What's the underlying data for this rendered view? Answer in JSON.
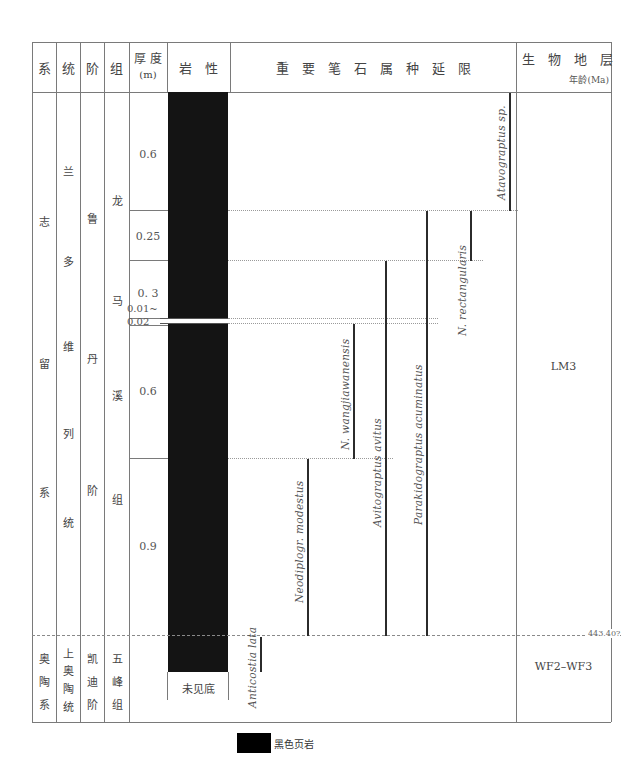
{
  "header": {
    "system": "系",
    "series": "统",
    "stage": "阶",
    "formation": "组",
    "thickness": "厚 度",
    "thickness_unit": "(m)",
    "lithology": "岩　性",
    "graptolite_ranges": "重　要　笔　石　属　种　延　限",
    "biozone": "生　物　地　层",
    "age_unit": "年龄(Ma)"
  },
  "chronostrat": {
    "upper": {
      "system": [
        "志",
        "留",
        "系"
      ],
      "series": [
        "兰",
        "多",
        "维",
        "列",
        "统"
      ],
      "stage": [
        "鲁",
        "丹",
        "阶"
      ],
      "formation": [
        "龙",
        "马",
        "溪",
        "组"
      ]
    },
    "lower": {
      "system": [
        "奥",
        "陶",
        "系"
      ],
      "series": [
        "上",
        "奥",
        "陶",
        "统"
      ],
      "stage": [
        "凯",
        "迪",
        "阶"
      ],
      "formation": [
        "五",
        "峰",
        "组"
      ]
    }
  },
  "thickness_layers": [
    {
      "value": "0.6"
    },
    {
      "value": "0.25"
    },
    {
      "value": "0. 3"
    },
    {
      "value": "0.01~",
      "value2": "0.02"
    },
    {
      "value": "0.6"
    },
    {
      "value": "0.9"
    }
  ],
  "lithology": {
    "bottom_note": "未见底",
    "fill_color": "#141414"
  },
  "species": [
    {
      "name": "Atavograptus sp.",
      "from_layer": 0,
      "to_layer": 0
    },
    {
      "name": "N. rectangularis",
      "from_layer": 1,
      "to_layer": 1
    },
    {
      "name": "Parakidograptus  acuminatus",
      "from_layer": 1,
      "to_layer": 5
    },
    {
      "name": "Avitograptus  avitus",
      "from_layer": 2,
      "to_layer": 5
    },
    {
      "name": "N. wangjiawanensis",
      "from_layer": 4,
      "to_layer": 4
    },
    {
      "name": "Neodiplogr. modestus",
      "from_layer": 5,
      "to_layer": 5
    },
    {
      "name": "Anticostia lata",
      "from_layer": 6,
      "to_layer": 6
    }
  ],
  "biozones": {
    "upper": "LM3",
    "lower": "WF2–WF3",
    "boundary_age": "443.40?"
  },
  "legend": {
    "label": "黑色页岩",
    "swatch_color": "#000000"
  }
}
